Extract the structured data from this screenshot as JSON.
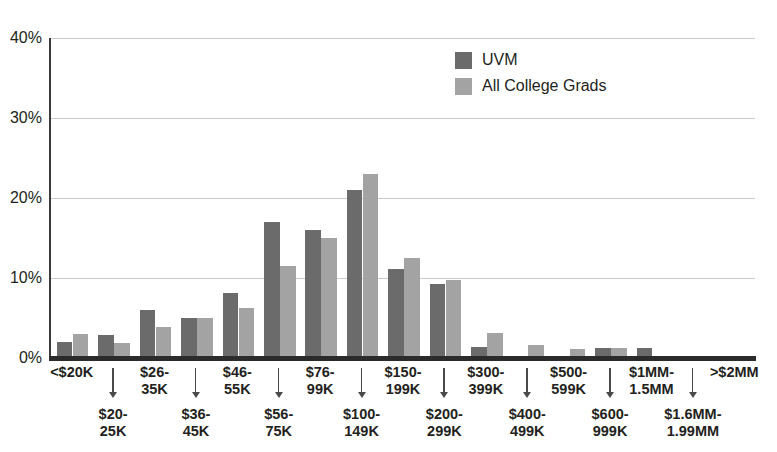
{
  "chart_data": {
    "type": "bar",
    "title": "",
    "xlabel": "",
    "ylabel": "",
    "ylim": [
      0,
      40
    ],
    "ytick_labels": [
      "0%",
      "10%",
      "20%",
      "30%",
      "40%"
    ],
    "ytick_values": [
      0,
      10,
      20,
      30,
      40
    ],
    "grid": true,
    "legend_position": "top-center-right",
    "categories": [
      "<$20K",
      "$20-\n25K",
      "$26-\n35K",
      "$36-\n45K",
      "$46-\n55K",
      "$56-\n75K",
      "$76-\n99K",
      "$100-\n149K",
      "$150-\n199K",
      "$200-\n299K",
      "$300-\n399K",
      "$400-\n499K",
      "$500-\n599K",
      "$600-\n999K",
      "$1MM-\n1.5MM",
      "$1.6MM-\n1.99MM",
      ">$2MM"
    ],
    "category_rows": [
      "top",
      "bottom",
      "top",
      "bottom",
      "top",
      "bottom",
      "top",
      "bottom",
      "top",
      "bottom",
      "top",
      "bottom",
      "top",
      "bottom",
      "top",
      "bottom",
      "top"
    ],
    "series": [
      {
        "name": "UVM",
        "color": "#6b6b6b",
        "values": [
          2.0,
          2.9,
          6.0,
          5.0,
          8.1,
          17.0,
          16.0,
          21.0,
          11.1,
          9.2,
          1.4,
          0.0,
          0.0,
          1.3,
          1.2,
          0.0,
          0.0
        ]
      },
      {
        "name": "All College Grads",
        "color": "#a3a3a3",
        "values": [
          3.0,
          1.9,
          3.9,
          5.0,
          6.2,
          11.5,
          15.0,
          23.0,
          12.5,
          9.7,
          3.1,
          1.6,
          1.1,
          1.2,
          0.0,
          0.0,
          0.0
        ]
      }
    ]
  },
  "legend": {
    "items": [
      {
        "label": "UVM",
        "color": "#6b6b6b"
      },
      {
        "label": "All College Grads",
        "color": "#a3a3a3"
      }
    ]
  }
}
